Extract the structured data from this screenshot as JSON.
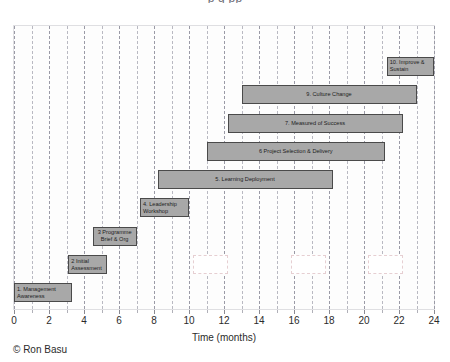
{
  "figure": {
    "clipped_title": "p                                g   pp",
    "copyright": "© Ron Basu"
  },
  "chart_data": {
    "type": "bar",
    "orientation": "horizontal",
    "subtype": "gantt",
    "title": "",
    "xlabel": "Time (months)",
    "ylabel": "",
    "xlim": [
      0,
      24
    ],
    "ylim": [
      0,
      10
    ],
    "grid": true,
    "legend": "none",
    "xticks": [
      0,
      2,
      4,
      6,
      8,
      10,
      12,
      14,
      16,
      18,
      20,
      22,
      24
    ],
    "xtick_labels": [
      "0",
      "2",
      "4",
      "6",
      "8",
      "10",
      "12",
      "14",
      "16",
      "18",
      "20",
      "22",
      "24"
    ],
    "minor_gridlines_every": 1,
    "bar_fill_color": "#a8a8a8",
    "bar_edge_color": "#4a4a4a",
    "categories": [
      "1. Management Awareness",
      "2 Initial Assessment",
      "3 Programme Brief & Org",
      "4. Leadership Workshop",
      "5. Learning Deployment",
      "6 Project Selection & Delivery",
      "7. Measured of Success",
      "9. Culture Change",
      "10. Improve & Sustain"
    ],
    "tasks": [
      {
        "label": "1. Management Awareness",
        "start": 0.0,
        "end": 3.3,
        "row": 0,
        "align": "left"
      },
      {
        "label": "2 Initial Assessment",
        "start": 3.1,
        "end": 5.3,
        "row": 1,
        "align": "left"
      },
      {
        "label": "3 Programme Brief & Org",
        "start": 4.5,
        "end": 7.0,
        "row": 2,
        "align": "center"
      },
      {
        "label": "4. Leadership Workshop",
        "start": 7.2,
        "end": 10.0,
        "row": 3,
        "align": "left"
      },
      {
        "label": "5. Learning Deployment",
        "start": 8.2,
        "end": 18.2,
        "row": 4,
        "align": "center"
      },
      {
        "label": "6 Project Selection & Delivery",
        "start": 11.0,
        "end": 21.2,
        "row": 5,
        "align": "center"
      },
      {
        "label": "7. Measured of Success",
        "start": 12.2,
        "end": 22.2,
        "row": 6,
        "align": "center"
      },
      {
        "label": "9. Culture Change",
        "start": 13.0,
        "end": 23.0,
        "row": 7,
        "align": "center"
      },
      {
        "label": "10. Improve & Sustain",
        "start": 21.3,
        "end": 24.0,
        "row": 8,
        "align": "left"
      }
    ],
    "ghost_boxes": [
      {
        "start": 10.2,
        "end": 12.2,
        "row": 1
      },
      {
        "start": 15.8,
        "end": 17.8,
        "row": 1
      },
      {
        "start": 20.2,
        "end": 22.2,
        "row": 1
      }
    ]
  }
}
